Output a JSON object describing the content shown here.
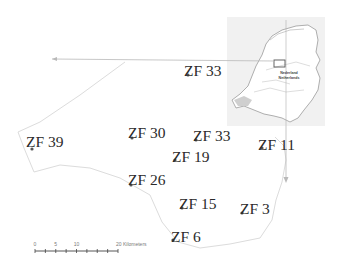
{
  "map": {
    "type": "study-area map",
    "stations": [
      {
        "label": "ZF 33",
        "id": "ZF33-north"
      },
      {
        "label": "ZF 39",
        "id": "ZF39"
      },
      {
        "label": "ZF 30",
        "id": "ZF30"
      },
      {
        "label": "ZF 33",
        "id": "ZF33-south"
      },
      {
        "label": "ZF 11",
        "id": "ZF11"
      },
      {
        "label": "ZF 19",
        "id": "ZF19"
      },
      {
        "label": "ZF 26",
        "id": "ZF26"
      },
      {
        "label": "ZF 15",
        "id": "ZF15"
      },
      {
        "label": "ZF 3",
        "id": "ZF3"
      },
      {
        "label": "ZF 6",
        "id": "ZF6"
      }
    ],
    "inset": {
      "title_line1": "Nederland",
      "title_line2": "Netherlands"
    },
    "scale_bar": {
      "ticks": [
        "0",
        "5",
        "10",
        "20 Kilometers"
      ],
      "unit": "Kilometers",
      "max": 20
    },
    "colors": {
      "outline": "#d8d8d8",
      "arrow": "#b9b9b9",
      "label": "#2a2a2a",
      "inset_bg": "#eeeeee"
    }
  }
}
